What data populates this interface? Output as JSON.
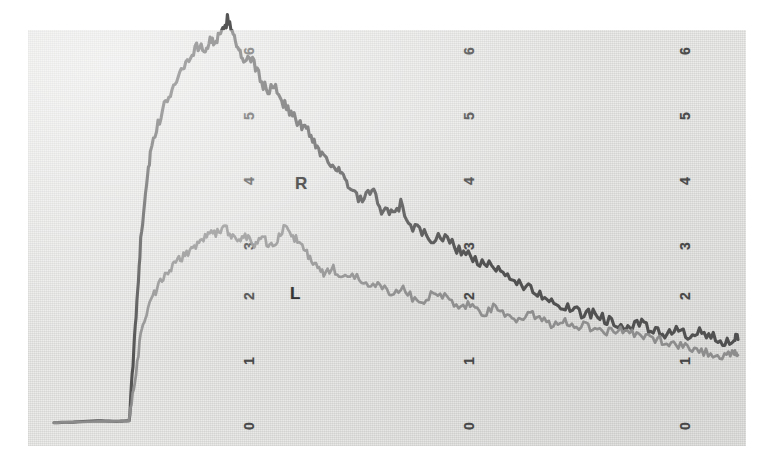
{
  "figure": {
    "background_color": "#ffffff",
    "plate_color": "#ececeb"
  },
  "axes": {
    "tick_labels": [
      "6",
      "5",
      "4",
      "3",
      "2",
      "1",
      "0"
    ],
    "columns": 3,
    "orientation": "rotated-90"
  },
  "labels": {
    "r": "R",
    "l": "L"
  },
  "chart_data": {
    "type": "line",
    "title": "",
    "xlabel": "",
    "ylabel": "",
    "grid": false,
    "legend": "inline-annotation",
    "ylim": [
      0,
      6.5
    ],
    "xlim": [
      0,
      718
    ],
    "yticks": [
      0,
      1,
      2,
      3,
      4,
      5,
      6
    ],
    "repeated_y_axes": 3,
    "series": [
      {
        "name": "R",
        "color": "#4c4c4c",
        "label_text": "R",
        "x": [
          0,
          20,
          45,
          65,
          78,
          82,
          86,
          90,
          95,
          100,
          108,
          116,
          124,
          132,
          140,
          148,
          156,
          162,
          168,
          174,
          180,
          186,
          192,
          198,
          206,
          214,
          222,
          230,
          238,
          246,
          254,
          262,
          270,
          278,
          286,
          294,
          302,
          310,
          320,
          330,
          340,
          350,
          360,
          370,
          382,
          394,
          406,
          418,
          430,
          442,
          454,
          466,
          478,
          490,
          502,
          514,
          526,
          538,
          550,
          562,
          574,
          586,
          598,
          610,
          622,
          634,
          646,
          658,
          670,
          682,
          694,
          706,
          710
        ],
        "y": [
          0.02,
          0.03,
          0.05,
          0.04,
          0.05,
          0.9,
          1.9,
          2.8,
          3.6,
          4.15,
          4.6,
          4.95,
          5.2,
          5.45,
          5.6,
          5.82,
          5.75,
          5.88,
          5.92,
          5.98,
          6.22,
          6.05,
          5.72,
          5.55,
          5.62,
          5.3,
          5.12,
          5.2,
          4.95,
          4.78,
          4.62,
          4.55,
          4.35,
          4.15,
          4.05,
          3.92,
          3.75,
          3.55,
          3.42,
          3.6,
          3.3,
          3.22,
          3.38,
          3.05,
          2.95,
          2.82,
          2.9,
          2.7,
          2.6,
          2.48,
          2.42,
          2.3,
          2.22,
          2.12,
          2.0,
          1.95,
          1.82,
          1.75,
          1.68,
          1.72,
          1.6,
          1.55,
          1.48,
          1.55,
          1.42,
          1.38,
          1.48,
          1.32,
          1.4,
          1.35,
          1.28,
          1.32,
          1.3
        ]
      },
      {
        "name": "L",
        "color": "#8e8e8e",
        "label_text": "L",
        "x": [
          0,
          20,
          45,
          65,
          78,
          84,
          90,
          96,
          104,
          112,
          120,
          128,
          136,
          144,
          152,
          160,
          168,
          176,
          184,
          192,
          200,
          208,
          216,
          224,
          232,
          240,
          248,
          256,
          264,
          272,
          280,
          290,
          300,
          312,
          324,
          336,
          348,
          360,
          372,
          384,
          396,
          408,
          420,
          432,
          444,
          456,
          468,
          480,
          492,
          504,
          516,
          528,
          540,
          552,
          564,
          576,
          588,
          600,
          612,
          624,
          636,
          648,
          660,
          672,
          684,
          696,
          706,
          710
        ],
        "y": [
          0.02,
          0.03,
          0.04,
          0.04,
          0.05,
          0.7,
          1.35,
          1.7,
          2.0,
          2.22,
          2.35,
          2.5,
          2.6,
          2.72,
          2.82,
          2.9,
          2.95,
          3.02,
          2.92,
          2.82,
          2.9,
          2.78,
          2.88,
          2.75,
          2.82,
          3.05,
          2.9,
          2.75,
          2.58,
          2.45,
          2.3,
          2.38,
          2.22,
          2.3,
          2.12,
          2.18,
          2.02,
          2.1,
          1.95,
          1.9,
          2.05,
          1.92,
          1.8,
          1.82,
          1.7,
          1.78,
          1.68,
          1.6,
          1.7,
          1.62,
          1.55,
          1.6,
          1.5,
          1.52,
          1.45,
          1.42,
          1.48,
          1.38,
          1.35,
          1.3,
          1.28,
          1.22,
          1.18,
          1.12,
          1.08,
          1.05,
          1.07,
          1.06
        ]
      }
    ]
  }
}
